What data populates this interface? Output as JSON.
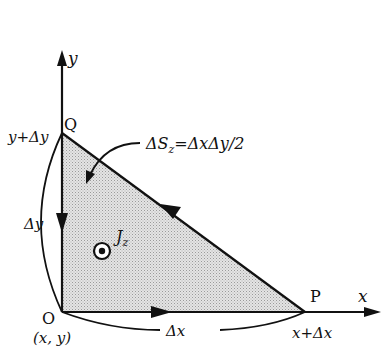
{
  "diagram": {
    "axes": {
      "x_label": "x",
      "y_label": "y"
    },
    "points": {
      "O": {
        "name": "O",
        "coord_label": "(x, y)"
      },
      "P": {
        "name": "P",
        "coord_label": "x+Δx"
      },
      "Q": {
        "name": "Q",
        "coord_label": "y+Δy"
      }
    },
    "dimensions": {
      "dx": "Δx",
      "dy": "Δy"
    },
    "area_label": {
      "prefix": "ΔS",
      "sub": "z",
      "formula": "=ΔxΔy/2"
    },
    "current": {
      "symbol": "J",
      "sub": "z",
      "direction": "out-of-page"
    },
    "colors": {
      "line": "#111111",
      "fill": "#d6d6d6",
      "background": "#ffffff"
    }
  }
}
